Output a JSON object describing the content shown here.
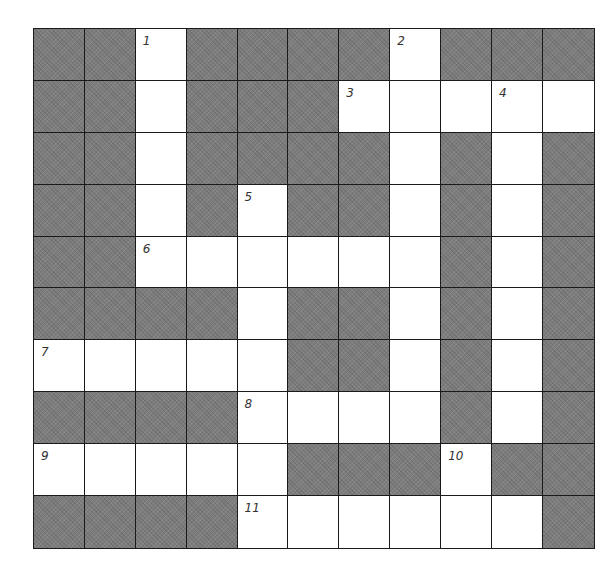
{
  "puzzle": {
    "type": "crossword",
    "rows": 10,
    "cols": 11,
    "colors": {
      "block": "#7d7d7d",
      "open": "#ffffff",
      "line": "#1a1a1a"
    },
    "layout": [
      "BB1BBBB2BBB",
      "BBWBBB3WW4W",
      "BBWBBBBWBWB",
      "BBWB5BBWBWB",
      "BB6WWWWWBWB",
      "BBBBWBBWBWB",
      "7WWWWBBWBWB",
      "BBBB8WWWBWB",
      "9WWWWBBB10BB",
      "BBBB11WWWWWB"
    ],
    "numbers": [
      {
        "n": "1",
        "row": 0,
        "col": 2
      },
      {
        "n": "2",
        "row": 0,
        "col": 7
      },
      {
        "n": "3",
        "row": 1,
        "col": 6
      },
      {
        "n": "4",
        "row": 1,
        "col": 9
      },
      {
        "n": "5",
        "row": 3,
        "col": 4
      },
      {
        "n": "6",
        "row": 4,
        "col": 2
      },
      {
        "n": "7",
        "row": 6,
        "col": 0
      },
      {
        "n": "8",
        "row": 7,
        "col": 4
      },
      {
        "n": "9",
        "row": 8,
        "col": 0
      },
      {
        "n": "10",
        "row": 8,
        "col": 8
      },
      {
        "n": "11",
        "row": 9,
        "col": 4
      }
    ],
    "cells": [
      [
        "B",
        "B",
        "1",
        "B",
        "B",
        "B",
        "B",
        "2",
        "B",
        "B",
        "B"
      ],
      [
        "B",
        "B",
        "W",
        "B",
        "B",
        "B",
        "3",
        "W",
        "W",
        "4",
        "W"
      ],
      [
        "B",
        "B",
        "W",
        "B",
        "B",
        "B",
        "B",
        "W",
        "B",
        "W",
        "B"
      ],
      [
        "B",
        "B",
        "W",
        "B",
        "5",
        "B",
        "B",
        "W",
        "B",
        "W",
        "B"
      ],
      [
        "B",
        "B",
        "6",
        "W",
        "W",
        "W",
        "W",
        "W",
        "B",
        "W",
        "B"
      ],
      [
        "B",
        "B",
        "B",
        "B",
        "W",
        "B",
        "B",
        "W",
        "B",
        "W",
        "B"
      ],
      [
        "7",
        "W",
        "W",
        "W",
        "W",
        "B",
        "B",
        "W",
        "B",
        "W",
        "B"
      ],
      [
        "B",
        "B",
        "B",
        "B",
        "8",
        "W",
        "W",
        "W",
        "B",
        "W",
        "B"
      ],
      [
        "9",
        "W",
        "W",
        "W",
        "W",
        "B",
        "B",
        "B",
        "10",
        "B",
        "B"
      ],
      [
        "B",
        "B",
        "B",
        "B",
        "11",
        "W",
        "W",
        "W",
        "W",
        "W",
        "B"
      ]
    ],
    "entries": {}
  }
}
